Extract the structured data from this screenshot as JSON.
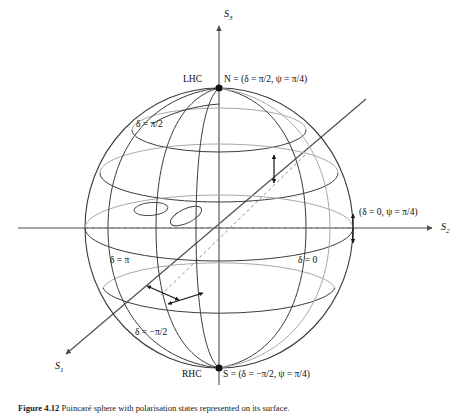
{
  "figure": {
    "caption_number": "Figure 4.12",
    "caption_text": "Poincaré sphere with polarisation states represented on its surface."
  },
  "axes": [
    {
      "name": "S3",
      "label": "S",
      "subscript": "3",
      "direction": "up"
    },
    {
      "name": "S2",
      "label": "S",
      "subscript": "2",
      "direction": "right"
    },
    {
      "name": "S1",
      "label": "S",
      "subscript": "1",
      "direction": "down-left"
    }
  ],
  "points": [
    {
      "name": "north-pole",
      "prefix": "LHC",
      "label": "N = (δ = π/2, ψ = π/4)"
    },
    {
      "name": "south-pole",
      "prefix": "RHC",
      "label": "S = (δ = −π/2, ψ = π/4)"
    },
    {
      "name": "equator-right",
      "prefix": "",
      "label": "(δ = 0, ψ = π/4)"
    }
  ],
  "meridian_labels": [
    {
      "name": "delta-pi-over-2",
      "text": "δ = π/2"
    },
    {
      "name": "delta-pi",
      "text": "δ = π"
    },
    {
      "name": "delta-zero",
      "text": "δ = 0"
    },
    {
      "name": "delta-minus-pi-over-2",
      "text": "δ = −π/2"
    }
  ],
  "colors": {
    "line": "#3c3c3c",
    "line_light": "#8a8a8a",
    "axis": "#4a4a4a",
    "dashed": "#6e6e6e",
    "text": "#0d0d0d",
    "background": "#ffffff"
  },
  "geometry": {
    "center_x": 219,
    "center_y": 228,
    "radius_x": 134,
    "radius_y": 140
  }
}
